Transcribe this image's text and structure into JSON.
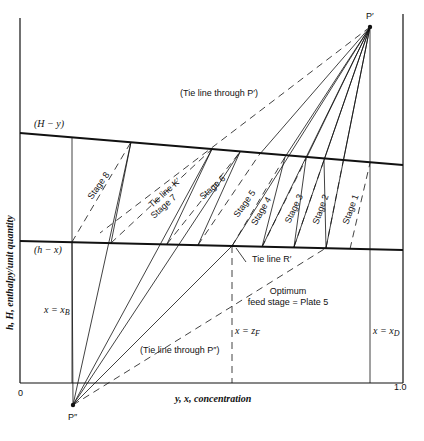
{
  "diagram": {
    "y_axis_label": "h, H, enthalpy/unit quantity",
    "x_axis_label": "y, x, concentration",
    "x_tick_start": "0",
    "x_tick_end": "1.0",
    "vapor_curve_label": "(H − y)",
    "liquid_curve_label": "(h − x)",
    "point_top": "P′",
    "point_bottom": "P″",
    "tie_line_top_label": "(Tie line through P′)",
    "tie_line_bottom_label": "(Tie line through P″)",
    "tie_line_k_label": "Tie line K′",
    "tie_line_r_label": "Tie line R′",
    "x_b_label": "x = x",
    "x_b_sub": "B",
    "x_d_label": "x = x",
    "x_d_sub": "D",
    "z_f_label": "x = z",
    "z_f_sub": "F",
    "optimum_line1": "Optimum",
    "optimum_line2": "feed stage = Plate 5",
    "stages": [
      "Stage 1",
      "Stage 2",
      "Stage 3",
      "Stage 4",
      "Stage 5",
      "Stage 6",
      "Stage 7",
      "Stage 8"
    ]
  }
}
